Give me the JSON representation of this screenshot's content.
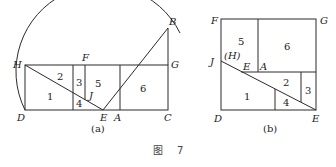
{
  "figure_a": {
    "label": "(a)",
    "points": {
      "H": "H",
      "F": "F",
      "B": "B",
      "G": "G",
      "D": "D",
      "E": "E",
      "A": "A",
      "C": "C",
      "J": "J"
    },
    "regions": [
      "1",
      "2",
      "3",
      "4",
      "5",
      "6"
    ]
  },
  "figure_b": {
    "label": "(b)",
    "points": {
      "F": "F",
      "G": "G",
      "J": "J",
      "H": "(H)",
      "E_top": "E",
      "A": "A",
      "D": "D",
      "E": "E"
    },
    "regions": [
      "1",
      "2",
      "3",
      "4",
      "5",
      "6"
    ]
  },
  "caption": {
    "prefix": "图",
    "number": "7"
  }
}
